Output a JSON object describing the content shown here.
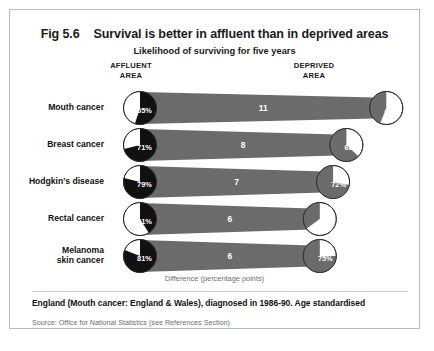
{
  "figure": {
    "number": "Fig 5.6",
    "title": "Survival is better in affluent than in deprived areas",
    "subtitle": "Likelihood of surviving for five years",
    "affluent_head_line1": "AFFLUENT",
    "affluent_head_line2": "AREA",
    "deprived_head_line1": "DEPRIVED",
    "deprived_head_line2": "AREA",
    "diff_caption": "Difference (percentage points)",
    "note": "England (Mouth cancer: England & Wales), diagnosed in 1986-90. Age standardised",
    "source": "Source: Office for National Statistics (see References Section)"
  },
  "colors": {
    "affluent_pie": "#111111",
    "deprived_pie": "#6b6b6b",
    "band": "#6b6b6b",
    "pie_empty": "#ffffff",
    "pie_stroke": "#2b2b2b",
    "frame_border": "#b9b9b9",
    "muted_text": "#6d6d6d"
  },
  "chart_data": {
    "type": "pie",
    "title": "Survival is better in affluent than in deprived areas",
    "subtitle": "Likelihood of surviving for five years",
    "xlabel": "Difference (percentage points)",
    "ylabel": "",
    "series": [
      {
        "name": "AFFLUENT AREA",
        "values": [
          55,
          71,
          79,
          41,
          81
        ]
      },
      {
        "name": "DEPRIVED AREA",
        "values": [
          44,
          63,
          72,
          35,
          75
        ]
      }
    ],
    "categories": [
      "Mouth cancer",
      "Breast cancer",
      "Hodgkin's disease",
      "Rectal cancer",
      "Melanoma skin cancer"
    ],
    "difference": [
      11,
      8,
      7,
      6,
      6
    ],
    "units": "percent surviving five years"
  },
  "rows": [
    {
      "label_line1": "Mouth cancer",
      "label_line2": "",
      "affluent": "55%",
      "deprived": "44%",
      "difference": "11",
      "affluent_value": 55,
      "deprived_value": 44,
      "diff_value": 11
    },
    {
      "label_line1": "Breast cancer",
      "label_line2": "",
      "affluent": "71%",
      "deprived": "63%",
      "difference": "8",
      "affluent_value": 71,
      "deprived_value": 63,
      "diff_value": 8
    },
    {
      "label_line1": "Hodgkin's disease",
      "label_line2": "",
      "affluent": "79%",
      "deprived": "72%",
      "difference": "7",
      "affluent_value": 79,
      "deprived_value": 72,
      "diff_value": 7
    },
    {
      "label_line1": "Rectal cancer",
      "label_line2": "",
      "affluent": "41%",
      "deprived": "35%",
      "difference": "6",
      "affluent_value": 41,
      "deprived_value": 35,
      "diff_value": 6
    },
    {
      "label_line1": "Melanoma",
      "label_line2": "skin cancer",
      "affluent": "81%",
      "deprived": "75%",
      "difference": "6",
      "affluent_value": 81,
      "deprived_value": 75,
      "diff_value": 6
    }
  ]
}
